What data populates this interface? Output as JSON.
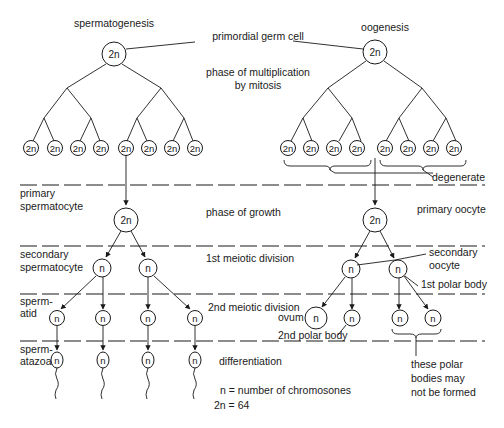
{
  "title_left": "spermatogenesis",
  "title_right": "oogenesis",
  "labels": {
    "primordial_germ_cell": "primordial germ cell",
    "multiplication_1": "phase of multiplication",
    "multiplication_2": "by mitosis",
    "degenerate": "degenerate",
    "primary_spermatocyte_1": "primary",
    "primary_spermatocyte_2": "spermatocyte",
    "phase_of_growth": "phase of growth",
    "primary_oocyte": "primary oocyte",
    "secondary_spermatocyte_1": "secondary",
    "secondary_spermatocyte_2": "spermatocyte",
    "first_meiotic": "1st meiotic division",
    "secondary_oocyte_1": "secondary",
    "secondary_oocyte_2": "oocyte",
    "first_polar_body": "1st polar body",
    "spermatid_1": "sperm-",
    "spermatid_2": "atid",
    "second_meiotic": "2nd meiotic division",
    "ovum": "ovum",
    "second_polar_body": "2nd polar body",
    "spermatozoa_1": "sperm-",
    "spermatozoa_2": "atazoa",
    "differentiation": "differentiation",
    "polar_note_1": "these polar",
    "polar_note_2": "bodies may",
    "polar_note_3": "not be formed",
    "legend_n": "n = number of chromosones",
    "legend_2n": "2n = 64"
  },
  "cells": {
    "diploid": "2n",
    "haploid": "n"
  },
  "stages": [
    "primordial germ cell",
    "phase of multiplication by mitosis",
    "phase of growth",
    "1st meiotic division",
    "2nd meiotic division",
    "differentiation"
  ]
}
